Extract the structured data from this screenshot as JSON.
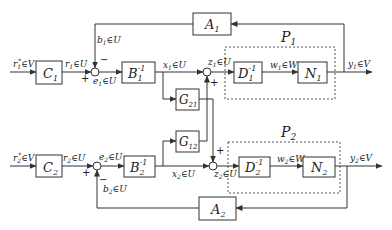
{
  "diagram": {
    "title": "",
    "blocks": {
      "C1": {
        "label": "C",
        "sub": "1",
        "sup": ""
      },
      "B1": {
        "label": "B",
        "sub": "1",
        "sup": "-1"
      },
      "A1": {
        "label": "A",
        "sub": "1",
        "sup": ""
      },
      "D1": {
        "label": "D",
        "sub": "1",
        "sup": "-1"
      },
      "N1": {
        "label": "N",
        "sub": "1",
        "sup": ""
      },
      "G21": {
        "label": "G",
        "sub": "21",
        "sup": ""
      },
      "G12": {
        "label": "G",
        "sub": "12",
        "sup": ""
      },
      "C2": {
        "label": "C",
        "sub": "2",
        "sup": ""
      },
      "B2": {
        "label": "B",
        "sub": "2",
        "sup": "-1"
      },
      "A2": {
        "label": "A",
        "sub": "2",
        "sup": ""
      },
      "D2": {
        "label": "D",
        "sub": "2",
        "sup": "-1"
      },
      "N2": {
        "label": "N",
        "sub": "2",
        "sup": ""
      }
    },
    "groups": {
      "P1": {
        "label": "P",
        "sub": "1"
      },
      "P2": {
        "label": "P",
        "sub": "2"
      }
    },
    "signals": {
      "r1star": {
        "name": "r",
        "sub": "1",
        "sup": "*",
        "set": "∈V"
      },
      "r1": {
        "name": "r",
        "sub": "1",
        "set": "∈U"
      },
      "b1": {
        "name": "b",
        "sub": "1",
        "set": "∈U"
      },
      "e1": {
        "name": "e",
        "sub": "1",
        "set": "∈U"
      },
      "x1": {
        "name": "x",
        "sub": "1",
        "set": "∈U"
      },
      "z1": {
        "name": "z",
        "sub": "1",
        "set": "∈U"
      },
      "w1": {
        "name": "w",
        "sub": "1",
        "set": "∈W"
      },
      "y1": {
        "name": "y",
        "sub": "1",
        "set": "∈V"
      },
      "r2star": {
        "name": "r",
        "sub": "2",
        "sup": "*",
        "set": "∈V"
      },
      "r2": {
        "name": "r",
        "sub": "2",
        "set": "∈U"
      },
      "b2": {
        "name": "b",
        "sub": "2",
        "set": "∈U"
      },
      "e2": {
        "name": "e",
        "sub": "2",
        "set": "∈U"
      },
      "x2": {
        "name": "x",
        "sub": "2",
        "set": "∈U"
      },
      "z2": {
        "name": "z",
        "sub": "2",
        "set": "∈U"
      },
      "w2": {
        "name": "w",
        "sub": "2",
        "set": "∈W"
      },
      "y2": {
        "name": "y",
        "sub": "2",
        "set": "∈V"
      }
    },
    "signs": {
      "e1_plus": "+",
      "e1_minus": "−",
      "z1_plus": "+",
      "e2_plus": "+",
      "e2_minus": "−",
      "z2_plus": "+"
    },
    "colors": {
      "line": "#333333",
      "text": "#222222",
      "background": "#ffffff"
    }
  }
}
